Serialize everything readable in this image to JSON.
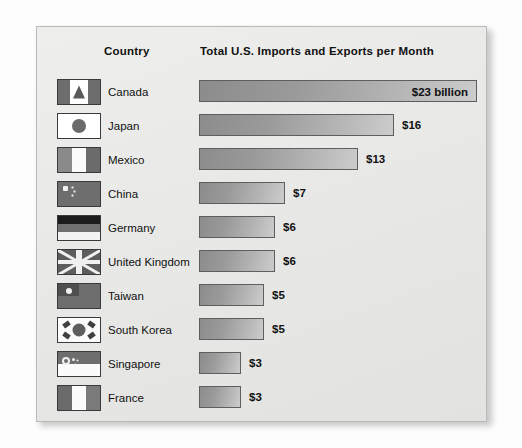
{
  "panel": {
    "background_color": "#e9e9e7",
    "border_color": "#b9b9b7"
  },
  "headers": {
    "country": "Country",
    "metric": "Total U.S. Imports and Exports per Month"
  },
  "chart_data": {
    "type": "bar",
    "orientation": "horizontal",
    "title": "Total U.S. Imports and Exports per Month",
    "xlabel": "",
    "ylabel": "Country",
    "unit": "billion U.S. dollars per month",
    "xlim": [
      0,
      23
    ],
    "grid": false,
    "legend": false,
    "categories": [
      "Canada",
      "Japan",
      "Mexico",
      "China",
      "Germany",
      "United Kingdom",
      "Taiwan",
      "South Korea",
      "Singapore",
      "France"
    ],
    "values": [
      23,
      16,
      13,
      7,
      6,
      6,
      5,
      5,
      3,
      3
    ],
    "value_labels": [
      "$23 billion",
      "$16",
      "$13",
      "$7",
      "$6",
      "$6",
      "$5",
      "$5",
      "$3",
      "$3"
    ],
    "bar_fill": "gradient-gray",
    "bar_border_color": "#5e5e5e"
  },
  "rows": [
    {
      "country": "Canada",
      "value": 23,
      "label": "$23 billion",
      "bar_px": 278,
      "label_inside": true,
      "flag": "flag-canada-icon",
      "flag_class": "f-ca"
    },
    {
      "country": "Japan",
      "value": 16,
      "label": "$16",
      "bar_px": 195,
      "label_inside": false,
      "flag": "flag-japan-icon",
      "flag_class": "f-jp"
    },
    {
      "country": "Mexico",
      "value": 13,
      "label": "$13",
      "bar_px": 159,
      "label_inside": false,
      "flag": "flag-mexico-icon",
      "flag_class": "f-mx"
    },
    {
      "country": "China",
      "value": 7,
      "label": "$7",
      "bar_px": 86,
      "label_inside": false,
      "flag": "flag-china-icon",
      "flag_class": "f-cn"
    },
    {
      "country": "Germany",
      "value": 6,
      "label": "$6",
      "bar_px": 76,
      "label_inside": false,
      "flag": "flag-germany-icon",
      "flag_class": "f-de"
    },
    {
      "country": "United Kingdom",
      "value": 6,
      "label": "$6",
      "bar_px": 76,
      "label_inside": false,
      "flag": "flag-united-kingdom-icon",
      "flag_class": "f-gb"
    },
    {
      "country": "Taiwan",
      "value": 5,
      "label": "$5",
      "bar_px": 65,
      "label_inside": false,
      "flag": "flag-taiwan-icon",
      "flag_class": "f-tw"
    },
    {
      "country": "South Korea",
      "value": 5,
      "label": "$5",
      "bar_px": 65,
      "label_inside": false,
      "flag": "flag-south-korea-icon",
      "flag_class": "f-kr"
    },
    {
      "country": "Singapore",
      "value": 3,
      "label": "$3",
      "bar_px": 42,
      "label_inside": false,
      "flag": "flag-singapore-icon",
      "flag_class": "f-sg"
    },
    {
      "country": "France",
      "value": 3,
      "label": "$3",
      "bar_px": 42,
      "label_inside": false,
      "flag": "flag-france-icon",
      "flag_class": "f-fr"
    }
  ]
}
